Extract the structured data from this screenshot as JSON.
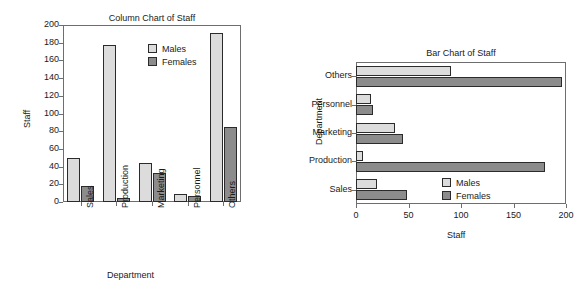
{
  "figure": {
    "background": "#ffffff",
    "colors": {
      "males": "#dcdcdc",
      "females": "#8c8c8c",
      "axis": "#6e6e6e",
      "outline": "#2b2b2b"
    }
  },
  "chart_data": [
    {
      "type": "bar",
      "orientation": "vertical",
      "title": "Column Chart of Staff",
      "xlabel": "Department",
      "ylabel": "Staff",
      "categories": [
        "Sales",
        "Production",
        "Marketing",
        "Personnel",
        "Others"
      ],
      "series": [
        {
          "name": "Males",
          "values": [
            50,
            177,
            44,
            9,
            191
          ],
          "color": "#dcdcdc"
        },
        {
          "name": "Females",
          "values": [
            18,
            5,
            33,
            7,
            85
          ],
          "color": "#8c8c8c"
        }
      ],
      "ylim": [
        0,
        200
      ],
      "yticks": [
        0,
        20,
        40,
        60,
        80,
        100,
        120,
        140,
        160,
        180,
        200
      ],
      "grid": false,
      "legend": {
        "position": "top-right",
        "entries": [
          "Males",
          "Females"
        ]
      },
      "xtick_rotation": 90
    },
    {
      "type": "bar",
      "orientation": "horizontal",
      "title": "Bar Chart of Staff",
      "xlabel": "Staff",
      "ylabel": "Department",
      "categories": [
        "Sales",
        "Production",
        "Marketing",
        "Personnel",
        "Others"
      ],
      "series": [
        {
          "name": "Males",
          "values": [
            20,
            7,
            37,
            14,
            90
          ],
          "color": "#dcdcdc"
        },
        {
          "name": "Females",
          "values": [
            49,
            180,
            45,
            16,
            196
          ],
          "color": "#8c8c8c"
        }
      ],
      "xlim": [
        0,
        200
      ],
      "xticks": [
        0,
        50,
        100,
        150,
        200
      ],
      "grid": false,
      "legend": {
        "position": "bottom-right",
        "entries": [
          "Males",
          "Females"
        ]
      },
      "ytick_rotation": 0
    }
  ],
  "column_chart": {
    "title": "Column Chart of Staff",
    "xlabel": "Department",
    "ylabel": "Staff",
    "yticks": [
      "0",
      "20",
      "40",
      "60",
      "80",
      "100",
      "120",
      "140",
      "160",
      "180",
      "200"
    ],
    "categories": [
      "Sales",
      "Production",
      "Marketing",
      "Personnel",
      "Others"
    ],
    "legend": {
      "males": "Males",
      "females": "Females"
    }
  },
  "bar_chart": {
    "title": "Bar Chart of Staff",
    "xlabel": "Staff",
    "ylabel": "Department",
    "xticks": [
      "0",
      "50",
      "100",
      "150",
      "200"
    ],
    "categories": [
      "Sales",
      "Production",
      "Marketing",
      "Personnel",
      "Others"
    ],
    "legend": {
      "males": "Males",
      "females": "Females"
    }
  }
}
